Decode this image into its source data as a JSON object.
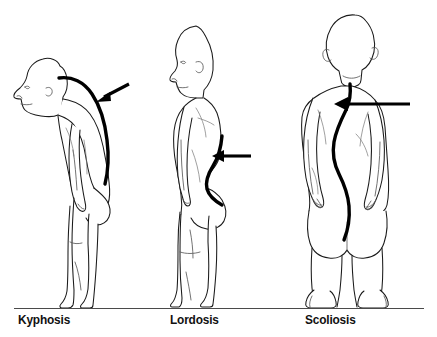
{
  "figure": {
    "background_color": "#ffffff",
    "ink_color": "#1a1a1a",
    "accent_color": "#000000",
    "ground_line_color": "#4a4a4a",
    "width": 437,
    "height": 337
  },
  "panels": [
    {
      "id": "kyphosis",
      "label": "Kyphosis",
      "view": "side profile, facing left",
      "posture": "stooped forward with rounded upper back hump",
      "spine_marking": "thick curved line along the thoracic spine",
      "arrow": {
        "name": "kyphosis-arrow",
        "direction": "down-left",
        "points_to": "upper back hump"
      }
    },
    {
      "id": "lordosis",
      "label": "Lordosis",
      "view": "side profile, facing left",
      "posture": "standing upright with exaggerated inward lower back curve",
      "spine_marking": "thick curved line along the lumbar spine",
      "arrow": {
        "name": "lordosis-arrow",
        "direction": "left",
        "points_to": "inward lumbar curve"
      }
    },
    {
      "id": "scoliosis",
      "label": "Scoliosis",
      "view": "rear view",
      "posture": "standing with sideways S-shaped spinal curvature",
      "spine_marking": "thick S-shaped line down the centre of the back",
      "arrow": {
        "name": "scoliosis-arrow",
        "direction": "left",
        "points_to": "sideways spinal curve"
      }
    }
  ],
  "icons": {
    "arrow": "arrow-left-icon",
    "spine": "spine-curve-icon"
  }
}
